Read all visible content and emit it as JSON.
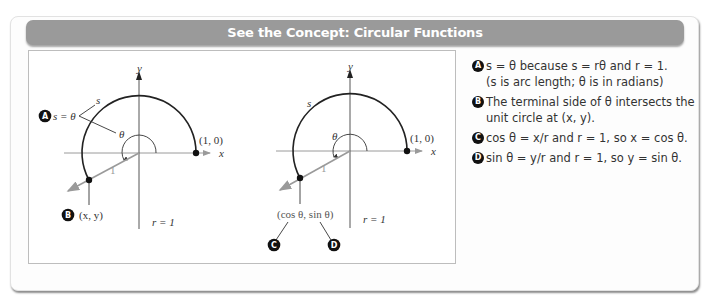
{
  "header": {
    "title": "See the Concept: Circular Functions"
  },
  "diagram_left": {
    "axis_x_label": "x",
    "axis_y_label": "y",
    "point_label": "(1, 0)",
    "radius_label": "1",
    "r_label": "r = 1",
    "arc_label": "s",
    "angle_label": "θ",
    "callout_a_label": "s = θ",
    "callout_a_badge": "A",
    "terminal_point_label": "(x, y)",
    "callout_b_badge": "B"
  },
  "diagram_right": {
    "axis_x_label": "x",
    "axis_y_label": "y",
    "point_label": "(1, 0)",
    "radius_label": "1",
    "r_label": "r = 1",
    "arc_label": "s",
    "angle_label": "θ",
    "terminal_point_label": "(cos θ, sin θ)",
    "callout_c_badge": "C",
    "callout_d_badge": "D"
  },
  "notes": [
    {
      "badge": "A",
      "text": "s = θ because s = rθ and r = 1.",
      "text2": "(s is arc length; θ is in radians)"
    },
    {
      "badge": "B",
      "text": "The terminal side of θ intersects the",
      "text2": "unit circle at (x, y)."
    },
    {
      "badge": "C",
      "text": "cos θ = x/r and r = 1, so x = cos θ."
    },
    {
      "badge": "D",
      "text": "sin θ = y/r and r = 1, so y = sin θ."
    }
  ]
}
